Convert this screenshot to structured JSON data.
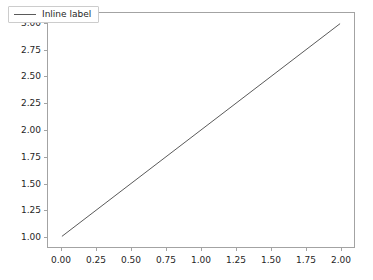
{
  "chart_data": {
    "type": "line",
    "title": "",
    "xlabel": "",
    "ylabel": "",
    "xlim": [
      -0.1,
      2.1
    ],
    "ylim": [
      0.9,
      3.1
    ],
    "grid": false,
    "legend_position": "upper left",
    "background_color": "#ffffff",
    "axes_color": "#a3a3a3",
    "tick_label_color": "#262626",
    "xticks": [
      0.0,
      0.25,
      0.5,
      0.75,
      1.0,
      1.25,
      1.5,
      1.75,
      2.0
    ],
    "xtick_labels": [
      "0.00",
      "0.25",
      "0.50",
      "0.75",
      "1.00",
      "1.25",
      "1.50",
      "1.75",
      "2.00"
    ],
    "yticks": [
      1.0,
      1.25,
      1.5,
      1.75,
      2.0,
      2.25,
      2.5,
      2.75,
      3.0
    ],
    "ytick_labels": [
      "1.00",
      "1.25",
      "1.50",
      "1.75",
      "2.00",
      "2.25",
      "2.50",
      "2.75",
      "3.00"
    ],
    "series": [
      {
        "name": "Inline label",
        "color": "#5a5a5a",
        "linewidth": 1,
        "x": [
          0.0,
          2.0
        ],
        "values": [
          1.0,
          3.0
        ]
      }
    ]
  },
  "legend": {
    "entries": [
      {
        "label": "Inline label",
        "color": "#5a5a5a"
      }
    ]
  }
}
